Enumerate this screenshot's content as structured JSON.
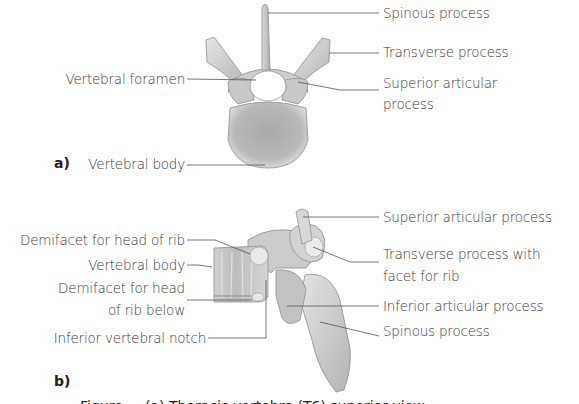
{
  "figure": {
    "panel_a": {
      "marker": "a)",
      "labels": {
        "spinous_process": "Spinous process",
        "transverse_process": "Transverse process",
        "superior_articular_line1": "Superior articular",
        "superior_articular_line2": "process",
        "vertebral_foramen": "Vertebral foramen",
        "vertebral_body": "Vertebral body"
      }
    },
    "panel_b": {
      "marker": "b)",
      "labels": {
        "superior_articular_process": "Superior articular process",
        "demifacet_head_rib": "Demifacet for head of rib",
        "vertebral_body": "Vertebral body",
        "demifacet_below_line1": "Demifacet for head",
        "demifacet_below_line2": "of rib below",
        "inferior_vertebral_notch": "Inferior vertebral notch",
        "transverse_with_facet_line1": "Transverse process with",
        "transverse_with_facet_line2": "facet for rib",
        "inferior_articular_process": "Inferior articular process",
        "spinous_process": "Spinous process"
      }
    },
    "caption": "Figure ... (a) Thoracic vertebra (T6) superior view ...",
    "colors": {
      "bone_fill": "#c9c9c9",
      "bone_light": "#e6e6e6",
      "bone_shadow": "#9a9a9a",
      "leader_line": "#555555",
      "text": "#3a3a3a"
    }
  }
}
